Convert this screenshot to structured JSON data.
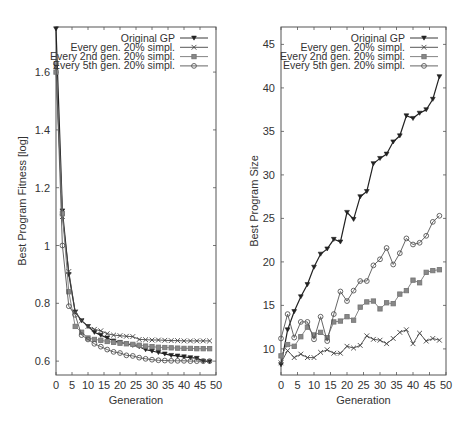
{
  "chart_data": [
    {
      "type": "line",
      "title": "",
      "xlabel": "Generation",
      "ylabel": "Best Program Fitness [log]",
      "xlim": [
        0,
        50
      ],
      "ylim": [
        0.552,
        1.756
      ],
      "xticks": [
        0,
        5,
        10,
        15,
        20,
        25,
        30,
        35,
        40,
        45,
        50
      ],
      "yticks": [
        0.6,
        0.8,
        1,
        1.2,
        1.4,
        1.6
      ],
      "ytick_labels": [
        "0.6",
        "0.8",
        "1",
        "1.2",
        "1.4",
        "1.6"
      ],
      "grid": false,
      "legend_position": "top-right",
      "x": [
        0,
        2,
        4,
        6,
        8,
        10,
        12,
        14,
        16,
        18,
        20,
        22,
        24,
        26,
        28,
        30,
        32,
        34,
        36,
        38,
        40,
        42,
        44,
        46,
        48
      ],
      "series": [
        {
          "name": "Original GP",
          "marker": "triangle-down",
          "values": [
            1.75,
            1.12,
            0.9,
            0.77,
            0.74,
            0.72,
            0.7,
            0.69,
            0.68,
            0.67,
            0.665,
            0.66,
            0.655,
            0.65,
            0.64,
            0.635,
            0.63,
            0.625,
            0.62,
            0.618,
            0.615,
            0.612,
            0.61,
            0.6,
            0.598
          ]
        },
        {
          "name": "Every gen. 20% simpl.",
          "marker": "x",
          "values": [
            1.62,
            1.1,
            0.91,
            0.77,
            0.74,
            0.72,
            0.71,
            0.705,
            0.695,
            0.69,
            0.688,
            0.686,
            0.685,
            0.675,
            0.674,
            0.673,
            0.673,
            0.672,
            0.671,
            0.671,
            0.67,
            0.67,
            0.67,
            0.67,
            0.67
          ]
        },
        {
          "name": "Every 2nd gen. 20% simpl.",
          "marker": "square",
          "values": [
            1.6,
            1.11,
            0.84,
            0.72,
            0.7,
            0.68,
            0.675,
            0.672,
            0.668,
            0.665,
            0.662,
            0.66,
            0.658,
            0.655,
            0.652,
            0.65,
            0.648,
            0.647,
            0.646,
            0.645,
            0.644,
            0.644,
            0.643,
            0.643,
            0.643
          ]
        },
        {
          "name": "Every 5th gen. 20% simpl.",
          "marker": "circle",
          "values": [
            1.63,
            1.0,
            0.79,
            0.76,
            0.69,
            0.675,
            0.66,
            0.65,
            0.64,
            0.632,
            0.628,
            0.62,
            0.618,
            0.612,
            0.608,
            0.605,
            0.603,
            0.602,
            0.601,
            0.601,
            0.601,
            0.6,
            0.6,
            0.6,
            0.6
          ]
        }
      ]
    },
    {
      "type": "line",
      "title": "",
      "xlabel": "Generation",
      "ylabel": "Best Program Size",
      "xlim": [
        0,
        50
      ],
      "ylim": [
        7,
        47
      ],
      "xticks": [
        0,
        5,
        10,
        15,
        20,
        25,
        30,
        35,
        40,
        45,
        50
      ],
      "yticks": [
        10,
        15,
        20,
        25,
        30,
        35,
        40,
        45
      ],
      "ytick_labels": [
        "10",
        "15",
        "20",
        "25",
        "30",
        "35",
        "40",
        "45"
      ],
      "grid": false,
      "legend_position": "top-right",
      "x": [
        0,
        2,
        4,
        6,
        8,
        10,
        12,
        14,
        16,
        18,
        20,
        22,
        24,
        26,
        28,
        30,
        32,
        34,
        36,
        38,
        40,
        42,
        44,
        46,
        48
      ],
      "series": [
        {
          "name": "Original GP",
          "marker": "triangle-down",
          "values": [
            8.2,
            12.2,
            14.3,
            16.0,
            17.4,
            19.4,
            20.9,
            21.5,
            22.6,
            22.3,
            25.7,
            24.9,
            27.5,
            28.1,
            31.3,
            31.9,
            32.4,
            33.8,
            34.5,
            36.8,
            36.5,
            37.1,
            37.5,
            38.7,
            41.3
          ]
        },
        {
          "name": "Every gen. 20% simpl.",
          "marker": "x",
          "values": [
            8.4,
            9.8,
            9.0,
            9.4,
            9.0,
            9.0,
            9.6,
            9.9,
            9.5,
            9.5,
            10.3,
            10.1,
            10.4,
            11.5,
            11.1,
            11.0,
            10.6,
            11.2,
            11.9,
            12.2,
            10.6,
            11.8,
            10.9,
            11.2,
            11.0
          ]
        },
        {
          "name": "Every 2nd gen. 20% simpl.",
          "marker": "square",
          "values": [
            9.2,
            10.5,
            10.3,
            11.4,
            12.5,
            11.6,
            11.9,
            11.3,
            13.1,
            13.2,
            13.7,
            13.3,
            14.8,
            15.4,
            15.5,
            14.6,
            15.3,
            15.2,
            16.3,
            16.7,
            17.9,
            17.6,
            18.8,
            19.0,
            19.1
          ]
        },
        {
          "name": "Every 5th gen. 20% simpl.",
          "marker": "circle",
          "values": [
            11.2,
            14.0,
            11.3,
            13.1,
            13.1,
            11.1,
            13.7,
            10.9,
            14.0,
            16.6,
            15.5,
            16.7,
            17.8,
            17.8,
            19.6,
            20.3,
            21.6,
            19.7,
            21.0,
            22.7,
            22.0,
            22.2,
            23.0,
            24.6,
            25.3
          ]
        }
      ]
    }
  ],
  "legend": {
    "entries": [
      "Original GP",
      "Every gen. 20% simpl.",
      "Every 2nd gen. 20% simpl.",
      "Every 5th gen. 20% simpl."
    ]
  },
  "left_chart": {
    "xlabel": "Generation",
    "ylabel": "Best Program Fitness [log]"
  },
  "right_chart": {
    "xlabel": "Generation",
    "ylabel": "Best Program Size"
  }
}
